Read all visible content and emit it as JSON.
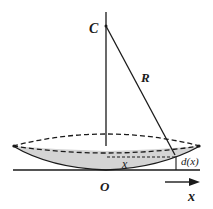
{
  "diagram": {
    "type": "lens-geometry",
    "labels": {
      "center": "C",
      "radius": "R",
      "origin": "O",
      "distance": "x",
      "thickness": "d(x)",
      "axis": "x"
    },
    "colors": {
      "ink": "#1a1a1a",
      "lens_fill": "#d4d4d4",
      "background": "#ffffff"
    }
  }
}
